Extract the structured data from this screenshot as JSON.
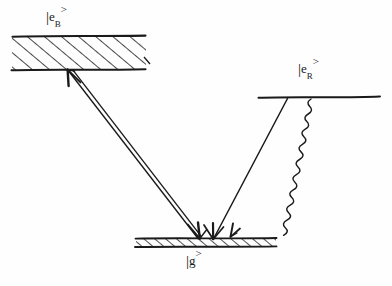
{
  "diagram": {
    "type": "energy-level-diagram",
    "background_color": "#fefefe",
    "ink_color": "#1a1a1a",
    "levels": [
      {
        "id": "eB",
        "name": "blue excited state",
        "symbol_open": "|",
        "symbol_base": "e",
        "symbol_sub": "B",
        "symbol_close": ">",
        "style": "hatched-band",
        "x1": 12,
        "x2": 146,
        "y_top": 36,
        "y_bottom": 70,
        "label_text": "|e_B>"
      },
      {
        "id": "eR",
        "name": "red excited state",
        "symbol_open": "|",
        "symbol_base": "e",
        "symbol_sub": "R",
        "symbol_close": ">",
        "style": "single-line",
        "x1": 258,
        "x2": 380,
        "y_top": 97,
        "y_bottom": 97,
        "label_text": "|e_R>"
      },
      {
        "id": "g",
        "name": "ground state",
        "symbol_open": "|",
        "symbol_base": "g",
        "symbol_sub": "",
        "symbol_close": ">",
        "style": "hatched-bar",
        "x1": 135,
        "x2": 277,
        "y_top": 238,
        "y_bottom": 247,
        "label_text": "|g>"
      }
    ],
    "transitions": [
      {
        "id": "blue-drive",
        "name": "blue driving transition",
        "style": "double-line-double-arrow",
        "from_level": "g",
        "to_level": "eB",
        "x1": 68,
        "y1": 70,
        "x2": 197,
        "y2": 238,
        "arrow_at_start": true,
        "arrow_at_end": true
      },
      {
        "id": "red-drive",
        "name": "red driving transition",
        "style": "straight-single-arrow",
        "from_level": "eR",
        "to_level": "g",
        "x1": 287,
        "y1": 98,
        "x2": 213,
        "y2": 238,
        "arrow_at_start": false,
        "arrow_at_end": true
      },
      {
        "id": "red-decay",
        "name": "spontaneous emission wavy decay",
        "style": "wavy-single-arrow",
        "from_level": "eR",
        "to_level": "g",
        "x1": 310,
        "y1": 99,
        "x2": 231,
        "y2": 236,
        "arrow_at_start": false,
        "arrow_at_end": true,
        "wave_amplitude": 3.1,
        "wave_period": 11
      }
    ],
    "hatching": {
      "angle_deg": 50,
      "direction": "forward-slash",
      "spacing_band": 11,
      "spacing_bar": 7
    }
  }
}
